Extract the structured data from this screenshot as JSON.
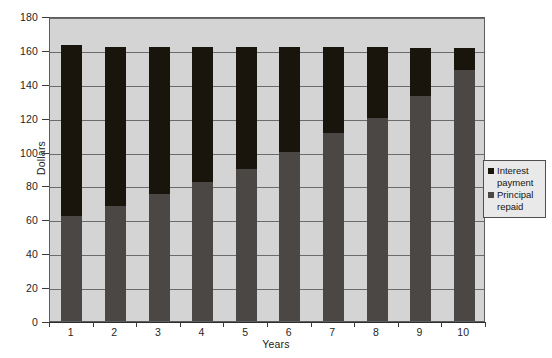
{
  "chart_data": {
    "type": "bar",
    "subtype": "stacked",
    "title": "",
    "xlabel": "Years",
    "ylabel": "Dollars",
    "categories": [
      "1",
      "2",
      "3",
      "4",
      "5",
      "6",
      "7",
      "8",
      "9",
      "10"
    ],
    "ylim": [
      0,
      180
    ],
    "yticks": [
      0,
      20,
      40,
      60,
      80,
      100,
      120,
      140,
      160,
      180
    ],
    "ytick_labels": [
      "0",
      "20",
      "40",
      "60",
      "80",
      "100",
      "120",
      "140",
      "160",
      "180"
    ],
    "grid": true,
    "grid_axis": "y",
    "legend_position": "right",
    "series": [
      {
        "name": "Principal repaid",
        "color": "#4a4744",
        "values": [
          62,
          68,
          75,
          82,
          90,
          100,
          111,
          120,
          133,
          148
        ]
      },
      {
        "name": "Interest payment",
        "color": "#19150d",
        "values": [
          101,
          94,
          87,
          80,
          72,
          62,
          51,
          42,
          28,
          13
        ]
      }
    ],
    "totals": [
      163,
      162,
      162,
      162,
      162,
      162,
      162,
      162,
      161,
      161
    ],
    "plot_background": "#d4d4d4",
    "grid_color": "#6b6b6b",
    "axis_color": "#5d5d5d"
  },
  "legend": {
    "items": [
      {
        "label_line1": "Interest",
        "label_line2": "payment",
        "color": "#19150d"
      },
      {
        "label_line1": "Principal",
        "label_line2": "repaid",
        "color": "#4a4744"
      }
    ]
  },
  "caption": {
    "text": ""
  }
}
